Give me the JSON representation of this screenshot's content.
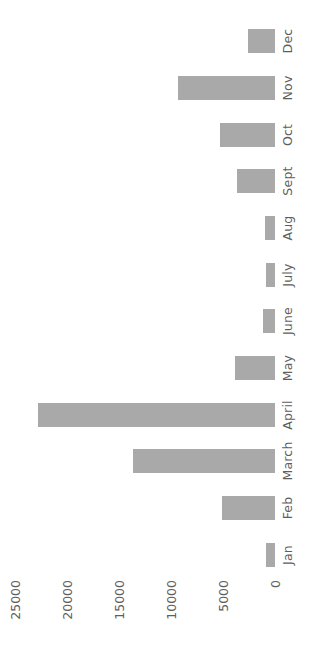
{
  "chart_data": {
    "type": "bar",
    "orientation": "horizontal-rotated",
    "title": "",
    "subtitle": "",
    "xlabel": "",
    "ylabel": "",
    "grid": false,
    "legend": null,
    "legend_position": "none",
    "bar_color": "#a9a9a9",
    "text_color": "#5e5e5e",
    "background_color": "#ffffff",
    "axis_range": [
      0,
      25000
    ],
    "axis_ticks": [
      0,
      5000,
      10000,
      15000,
      20000,
      25000
    ],
    "axis_tick_labels": [
      "0",
      "5000",
      "10000",
      "15000",
      "20000",
      "25000"
    ],
    "categories": [
      "Jan",
      "Feb",
      "March",
      "April",
      "May",
      "June",
      "July",
      "Aug",
      "Sept",
      "Oct",
      "Nov",
      "Dec"
    ],
    "values": [
      870,
      5100,
      13700,
      22800,
      3850,
      1150,
      870,
      960,
      3650,
      5300,
      9300,
      2600
    ],
    "points": [
      {
        "category": "Jan",
        "value": 870
      },
      {
        "category": "Feb",
        "value": 5100
      },
      {
        "category": "March",
        "value": 13700
      },
      {
        "category": "April",
        "value": 22800
      },
      {
        "category": "May",
        "value": 3850
      },
      {
        "category": "June",
        "value": 1150
      },
      {
        "category": "July",
        "value": 870
      },
      {
        "category": "Aug",
        "value": 960
      },
      {
        "category": "Sept",
        "value": 3650
      },
      {
        "category": "Oct",
        "value": 5300
      },
      {
        "category": "Nov",
        "value": 9300
      },
      {
        "category": "Dec",
        "value": 2600
      }
    ]
  }
}
